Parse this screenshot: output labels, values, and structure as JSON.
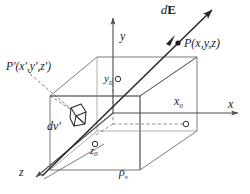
{
  "figure": {
    "kind": "physics-vector-field-diagram",
    "background_color": "#ffffff",
    "line_color": "#4d4d4d",
    "text_color": "#1a1a1a"
  },
  "axes": {
    "x": {
      "label": "x",
      "label_style": "italic"
    },
    "y": {
      "label": "y",
      "label_style": "italic"
    },
    "z": {
      "label": "z",
      "label_style": "italic"
    }
  },
  "markers": {
    "x0": {
      "label": "x",
      "subscript": "0",
      "marker": "open-circle"
    },
    "y0": {
      "label": "y",
      "subscript": "0",
      "marker": "open-circle"
    },
    "z0": {
      "label": "z",
      "subscript": "0",
      "marker": "open-circle"
    }
  },
  "labels": {
    "field_vector": {
      "italic_part": "d",
      "bold_part": "E"
    },
    "field_point": {
      "text": "P(x,y,z)",
      "marker": "filled-dot"
    },
    "source_point": {
      "text": "P′(x′,y′,z′)"
    },
    "volume_element": {
      "text": "dv′"
    },
    "charge_density": {
      "symbol": "ρ",
      "subscript": "v"
    }
  }
}
